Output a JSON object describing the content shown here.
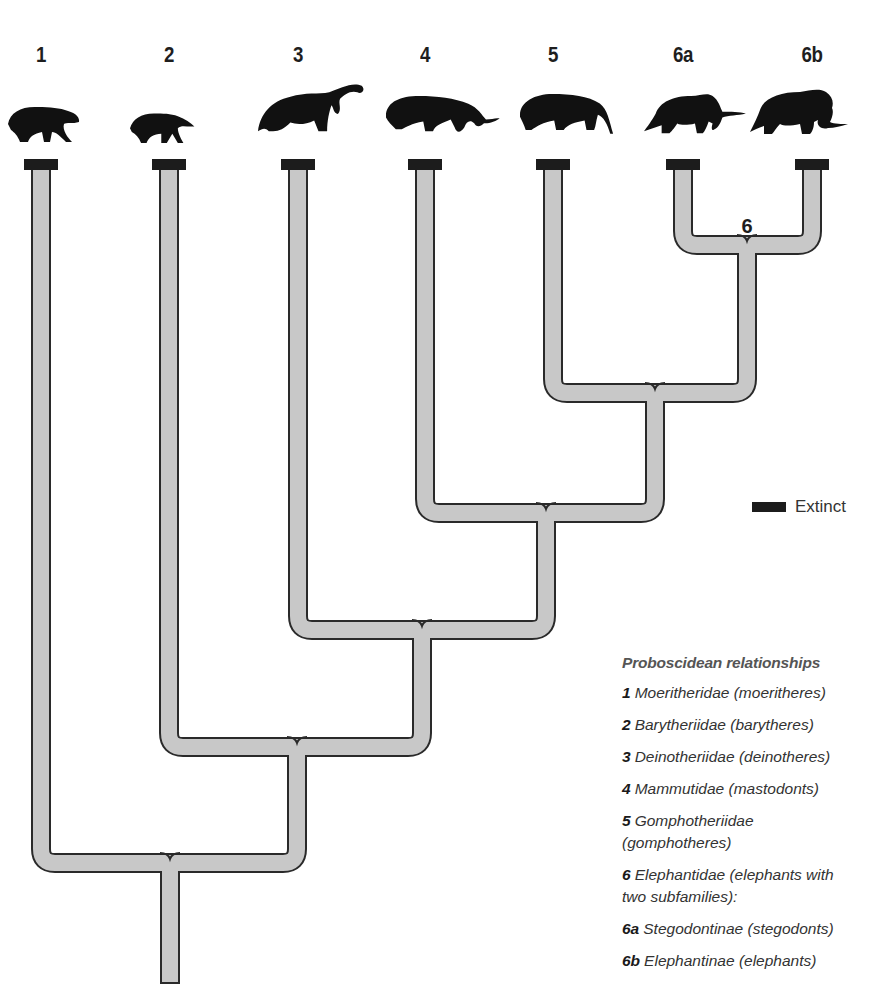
{
  "diagram": {
    "type": "cladogram",
    "title": "Proboscidean relationships",
    "colors": {
      "branch_fill": "#c8c8c8",
      "branch_outline": "#2a2a2a",
      "extinct_marker": "#1c1c1c",
      "silhouette": "#111111"
    },
    "taxa": [
      {
        "id": "1",
        "label": "1",
        "name": "Moeritheridae",
        "common": "(moeritheres)",
        "extinct": true,
        "icon": "moeritherium-silhouette-icon"
      },
      {
        "id": "2",
        "label": "2",
        "name": "Barytheriidae",
        "common": "(barytheres)",
        "extinct": true,
        "icon": "barytherium-silhouette-icon"
      },
      {
        "id": "3",
        "label": "3",
        "name": "Deinotheriidae",
        "common": "(deinotheres)",
        "extinct": true,
        "icon": "deinotherium-silhouette-icon"
      },
      {
        "id": "4",
        "label": "4",
        "name": "Mammutidae",
        "common": "(mastodonts)",
        "extinct": true,
        "icon": "mastodon-silhouette-icon"
      },
      {
        "id": "5",
        "label": "5",
        "name": "Gomphotheriidae",
        "common": "(gomphotheres)",
        "extinct": true,
        "icon": "gomphothere-silhouette-icon"
      },
      {
        "id": "6a",
        "label": "6a",
        "name": "Stegodontinae",
        "common": "(stegodonts)",
        "extinct": true,
        "icon": "stegodon-silhouette-icon"
      },
      {
        "id": "6b",
        "label": "6b",
        "name": "Elephantinae",
        "common": "(elephants)",
        "extinct": true,
        "icon": "elephant-silhouette-icon"
      }
    ],
    "clades": [
      {
        "id": "6",
        "label": "6",
        "members": [
          "6a",
          "6b"
        ]
      },
      {
        "id": "5+6",
        "label": "",
        "members": [
          "5",
          "6"
        ]
      },
      {
        "id": "4+",
        "label": "",
        "members": [
          "4",
          "5+6"
        ]
      },
      {
        "id": "3+",
        "label": "",
        "members": [
          "3",
          "4+"
        ]
      },
      {
        "id": "2+",
        "label": "",
        "members": [
          "2",
          "3+"
        ]
      },
      {
        "id": "root",
        "label": "",
        "members": [
          "1",
          "2+"
        ]
      }
    ],
    "key": {
      "extinct_label": "Extinct"
    }
  },
  "legend": {
    "title": "Proboscidean relationships",
    "items": [
      {
        "code": "1",
        "text": "Moeritheridae (moeritheres)"
      },
      {
        "code": "2",
        "text": "Barytheriidae (barytheres)"
      },
      {
        "code": "3",
        "text": "Deinotheriidae (deinotheres)"
      },
      {
        "code": "4",
        "text": "Mammutidae (mastodonts)"
      },
      {
        "code": "5",
        "text": "Gomphotheriidae (gomphotheres)"
      },
      {
        "code": "6",
        "text": "Elephantidae (elephants with two subfamilies):"
      },
      {
        "code": "6a",
        "text": "Stegodontinae (stegodonts)"
      },
      {
        "code": "6b",
        "text": "Elephantinae (elephants)"
      }
    ]
  }
}
